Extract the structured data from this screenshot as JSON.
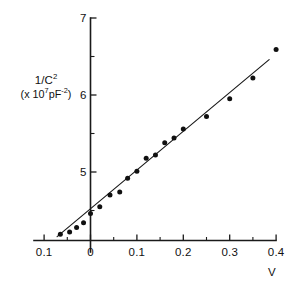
{
  "chart_data": {
    "type": "scatter",
    "title": "",
    "xlabel": "V",
    "ylabel_line1": "1/C2",
    "ylabel_line2": "(x 107pF-2)",
    "ylabel_main_base": "1/C",
    "ylabel_main_exp": "2",
    "ylabel_units_prefix": "(x 10",
    "ylabel_units_exp1": "7",
    "ylabel_units_mid": "pF",
    "ylabel_units_exp2": "-2",
    "ylabel_units_suffix": ")",
    "xlim": [
      -0.12,
      0.42
    ],
    "ylim": [
      4.0,
      7.05
    ],
    "grid": false,
    "legend": null,
    "x_ticks": [
      -0.1,
      0,
      0.1,
      0.2,
      0.3,
      0.4
    ],
    "x_tick_labels": [
      "0.1",
      "0",
      "0.1",
      "0.2",
      "0.3",
      "0.4"
    ],
    "x_minor_ticks": [
      -0.05,
      0.05,
      0.15,
      0.25,
      0.35
    ],
    "y_ticks": [
      5,
      6,
      7
    ],
    "y_tick_labels": [
      "5",
      "6",
      "7"
    ],
    "y_minor_ticks": [
      4.5,
      5.5,
      6.5
    ],
    "series": [
      {
        "name": "1/C^2 vs V",
        "marker": "filled-circle",
        "x": [
          -0.065,
          -0.045,
          -0.03,
          -0.015,
          0.0,
          0.02,
          0.042,
          0.063,
          0.08,
          0.1,
          0.12,
          0.14,
          0.16,
          0.18,
          0.2,
          0.25,
          0.3,
          0.35,
          0.4
        ],
        "y": [
          4.19,
          4.22,
          4.28,
          4.34,
          4.46,
          4.55,
          4.7,
          4.74,
          4.92,
          5.01,
          5.18,
          5.22,
          5.38,
          5.44,
          5.56,
          5.72,
          5.95,
          6.22,
          6.59
        ]
      }
    ],
    "fit_line": {
      "name": "linear fit",
      "x_start": -0.072,
      "y_start": 4.16,
      "x_end": 0.385,
      "y_end": 6.46
    }
  },
  "axis_labels": {
    "x_axis_name": "V"
  }
}
